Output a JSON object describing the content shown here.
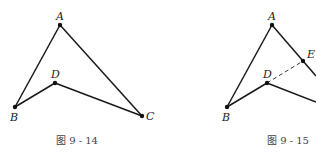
{
  "figures": [
    {
      "id": "fig-9-14",
      "caption": "图 9 - 14",
      "caption_pos": [
        77,
        144
      ],
      "points": {
        "A": {
          "label": "A",
          "x": 60,
          "y": 25,
          "lx": 56,
          "ly": 20
        },
        "B": {
          "label": "B",
          "x": 15,
          "y": 107,
          "lx": 10,
          "ly": 121
        },
        "C": {
          "label": "C",
          "x": 142,
          "y": 116,
          "lx": 146,
          "ly": 120
        },
        "D": {
          "label": "D",
          "x": 55,
          "y": 83,
          "lx": 51,
          "ly": 78
        }
      },
      "segments": [
        {
          "from": "A",
          "to": "B",
          "style": "solid"
        },
        {
          "from": "A",
          "to": "C",
          "style": "solid"
        },
        {
          "from": "B",
          "to": "D",
          "style": "solid"
        },
        {
          "from": "D",
          "to": "C",
          "style": "solid"
        }
      ]
    },
    {
      "id": "fig-9-15",
      "caption": "图 9 - 15",
      "caption_pos": [
        288,
        144
      ],
      "points": {
        "A": {
          "label": "A",
          "x": 272,
          "y": 25,
          "lx": 268,
          "ly": 20
        },
        "B": {
          "label": "B",
          "x": 227,
          "y": 107,
          "lx": 222,
          "ly": 121
        },
        "D": {
          "label": "D",
          "x": 267,
          "y": 83,
          "lx": 263,
          "ly": 78
        },
        "E": {
          "label": "E",
          "x": 303,
          "y": 61,
          "lx": 307,
          "ly": 58
        }
      },
      "segments": [
        {
          "from": "A",
          "to": "B",
          "style": "solid"
        },
        {
          "from": "A",
          "to": "E",
          "style": "solid"
        },
        {
          "from": "E",
          "to": "edge1",
          "style": "solid"
        },
        {
          "from": "B",
          "to": "D",
          "style": "solid"
        },
        {
          "from": "D",
          "to": "edge2",
          "style": "solid"
        },
        {
          "from": "D",
          "to": "E",
          "style": "dashed"
        }
      ],
      "edges": {
        "edge1": {
          "x": 316,
          "y": 76
        },
        "edge2": {
          "x": 316,
          "y": 102
        }
      }
    }
  ]
}
